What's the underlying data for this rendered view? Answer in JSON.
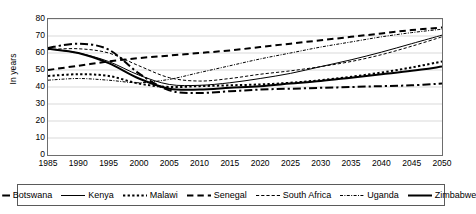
{
  "chart_data": {
    "type": "line",
    "title": "",
    "xlabel": "",
    "ylabel": "In years",
    "xlim": [
      1985,
      2050
    ],
    "ylim": [
      0,
      80
    ],
    "ytick_step": 10,
    "xtick_step": 5,
    "grid": true,
    "legend_position": "bottom",
    "xticks": [
      1985,
      1990,
      1995,
      2000,
      2005,
      2010,
      2015,
      2020,
      2025,
      2030,
      2035,
      2040,
      2045,
      2050
    ],
    "yticks": [
      0,
      10,
      20,
      30,
      40,
      50,
      60,
      70,
      80
    ],
    "x": [
      1985,
      1990,
      1995,
      2000,
      2005,
      2010,
      2015,
      2020,
      2025,
      2030,
      2035,
      2040,
      2045,
      2050
    ],
    "series": [
      {
        "name": "Botswana",
        "style": "dash-dot",
        "weight": "bold",
        "values": [
          63,
          65.5,
          62,
          48,
          38,
          36.5,
          37.5,
          38.5,
          39,
          39.5,
          40,
          40.5,
          41,
          42
        ]
      },
      {
        "name": "Kenya",
        "style": "solid",
        "weight": "thin",
        "values": [
          62.5,
          60,
          55,
          47,
          41.5,
          41,
          42.5,
          45,
          48,
          52,
          56,
          60.5,
          65.5,
          70.5
        ]
      },
      {
        "name": "Malawi",
        "style": "dotted",
        "weight": "bold",
        "values": [
          46.5,
          47.5,
          46.5,
          42,
          40,
          40.5,
          41,
          41.5,
          42.5,
          44,
          46,
          48.5,
          51.5,
          55
        ]
      },
      {
        "name": "Senegal",
        "style": "dashed",
        "weight": "bold",
        "values": [
          50,
          52.5,
          55,
          57,
          58.5,
          60,
          61.5,
          63.5,
          65.5,
          67.5,
          69.5,
          71.5,
          73.5,
          75
        ]
      },
      {
        "name": "South Africa",
        "style": "dashed",
        "weight": "thin",
        "values": [
          62,
          62.5,
          60,
          52.5,
          45.5,
          43.5,
          45,
          47.5,
          49.5,
          52,
          55,
          59,
          64,
          69.5
        ]
      },
      {
        "name": "Uganda",
        "style": "dash-dot-dot",
        "weight": "thin",
        "values": [
          44,
          45,
          44,
          42.5,
          44.5,
          48.5,
          52.5,
          56.5,
          60,
          63.5,
          66.5,
          69.5,
          72,
          74
        ]
      },
      {
        "name": "Zimbabwe",
        "style": "solid",
        "weight": "bold",
        "values": [
          62.5,
          60,
          54,
          45,
          39,
          38.5,
          39.5,
          40.5,
          42,
          43.5,
          45.5,
          47.5,
          49.5,
          52
        ]
      }
    ]
  },
  "axis": {
    "ylabel": "In years"
  },
  "legend": {
    "items": [
      {
        "label": "Botswana"
      },
      {
        "label": "Kenya"
      },
      {
        "label": "Malawi"
      },
      {
        "label": "Senegal"
      },
      {
        "label": "South Africa"
      },
      {
        "label": "Uganda"
      },
      {
        "label": "Zimbabwe"
      }
    ]
  }
}
